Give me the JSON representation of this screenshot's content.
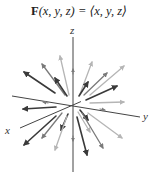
{
  "title": {
    "bold": "F",
    "rest": "(x, y, z) = ⟨x, y, z⟩"
  },
  "axes": {
    "x": {
      "label": "x",
      "from": [
        73,
        105
      ],
      "to": [
        20,
        128
      ],
      "label_pos": [
        5,
        134
      ]
    },
    "y": {
      "label": "y",
      "from": [
        12,
        96
      ],
      "to": [
        140,
        117
      ],
      "label_pos": [
        143,
        120
      ]
    },
    "z": {
      "label": "z",
      "from": [
        73,
        37
      ],
      "to": [
        73,
        172
      ],
      "label_pos": [
        70,
        34
      ]
    }
  },
  "colors": {
    "dark": "#3a3a3a",
    "medium": "#7a7a7a",
    "light": "#b5b5b5",
    "axis": "#444444"
  },
  "arrows": [
    {
      "from": [
        55,
        93
      ],
      "to": [
        24,
        72
      ],
      "shade": "dark"
    },
    {
      "from": [
        65,
        95
      ],
      "to": [
        42,
        64
      ],
      "shade": "medium"
    },
    {
      "from": [
        69,
        95
      ],
      "to": [
        60,
        56
      ],
      "shade": "light"
    },
    {
      "from": [
        67,
        96
      ],
      "to": [
        55,
        78
      ],
      "shade": "dark"
    },
    {
      "from": [
        80,
        94
      ],
      "to": [
        92,
        62
      ],
      "shade": "light"
    },
    {
      "from": [
        79,
        96
      ],
      "to": [
        88,
        82
      ],
      "shade": "dark"
    },
    {
      "from": [
        84,
        95
      ],
      "to": [
        107,
        73
      ],
      "shade": "medium"
    },
    {
      "from": [
        90,
        95
      ],
      "to": [
        124,
        66
      ],
      "shade": "light"
    },
    {
      "from": [
        86,
        100
      ],
      "to": [
        117,
        86
      ],
      "shade": "dark"
    },
    {
      "from": [
        90,
        103
      ],
      "to": [
        124,
        102
      ],
      "shade": "light"
    },
    {
      "from": [
        56,
        107
      ],
      "to": [
        23,
        109
      ],
      "shade": "dark"
    },
    {
      "from": [
        56,
        116
      ],
      "to": [
        24,
        145
      ],
      "shade": "dark"
    },
    {
      "from": [
        62,
        113
      ],
      "to": [
        42,
        138
      ],
      "shade": "medium"
    },
    {
      "from": [
        68,
        114
      ],
      "to": [
        61,
        130
      ],
      "shade": "dark"
    },
    {
      "from": [
        67,
        116
      ],
      "to": [
        55,
        150
      ],
      "shade": "light"
    },
    {
      "from": [
        77,
        117
      ],
      "to": [
        87,
        155
      ],
      "shade": "dark"
    },
    {
      "from": [
        80,
        110
      ],
      "to": [
        88,
        120
      ],
      "shade": "dark"
    },
    {
      "from": [
        82,
        113
      ],
      "to": [
        103,
        148
      ],
      "shade": "medium"
    },
    {
      "from": [
        88,
        113
      ],
      "to": [
        122,
        138
      ],
      "shade": "light"
    },
    {
      "from": [
        78,
        112
      ],
      "to": [
        90,
        132
      ],
      "shade": "light"
    }
  ],
  "axis_ticks": [
    {
      "from": [
        73,
        74
      ],
      "to": [
        73,
        69
      ],
      "shade": "medium"
    },
    {
      "from": [
        73,
        136
      ],
      "to": [
        73,
        141
      ],
      "shade": "medium"
    },
    {
      "from": [
        48,
        103
      ],
      "to": [
        43,
        102
      ],
      "shade": "medium"
    },
    {
      "from": [
        100,
        109
      ],
      "to": [
        105,
        110
      ],
      "shade": "medium"
    }
  ]
}
